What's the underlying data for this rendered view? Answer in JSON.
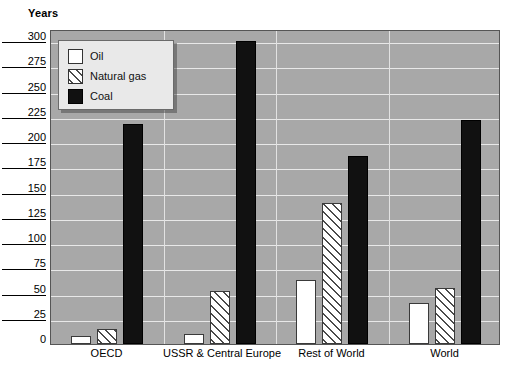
{
  "chart_data": {
    "type": "bar",
    "title": "",
    "ylabel": "Years",
    "xlabel": "",
    "ylim": [
      0,
      312
    ],
    "yticks": [
      0,
      25,
      50,
      75,
      100,
      125,
      150,
      175,
      200,
      225,
      250,
      275,
      300
    ],
    "ytick_labels": [
      "0",
      "25",
      "50",
      "75",
      "100",
      "125",
      "150",
      "175",
      "200",
      "225",
      "250",
      "275",
      "300"
    ],
    "grid": true,
    "legend_position": "upper-left",
    "categories": [
      "OECD",
      "USSR & Central Europe",
      "Rest of World",
      "World"
    ],
    "series": [
      {
        "name": "Oil",
        "values": [
          8,
          10,
          63,
          41
        ]
      },
      {
        "name": "Natural gas",
        "values": [
          15,
          52,
          140,
          55
        ]
      },
      {
        "name": "Coal",
        "values": [
          218,
          300,
          186,
          222
        ]
      }
    ],
    "colors": {
      "oil": "#ffffff",
      "natural_gas": "#ffffff",
      "coal": "#111111",
      "plot_background": "#a8a8a8",
      "gridline": "#e8e8e8",
      "legend_background": "#e9e9e9",
      "axis": "#555555"
    }
  }
}
